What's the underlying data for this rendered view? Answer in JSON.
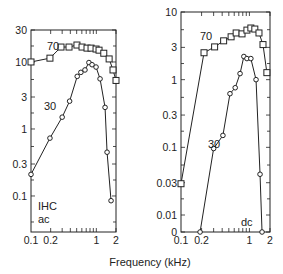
{
  "chart_data": [
    {
      "type": "line",
      "title": "",
      "panel_labels": [
        "IHC",
        "ac"
      ],
      "xlabel": "Frequency (kHz)",
      "ylabel": "",
      "xscale": "log",
      "yscale": "log",
      "xlim": [
        0.1,
        2
      ],
      "ylim": [
        0.029,
        30
      ],
      "xticks": [
        0.1,
        0.2,
        1,
        2
      ],
      "xtick_labels": [
        "0.1",
        "0.2",
        "1",
        "2"
      ],
      "yticks": [
        30,
        10,
        3,
        1,
        0.3,
        0.1
      ],
      "ytick_labels": [
        "30",
        "10",
        "3",
        "1",
        "0.3",
        "0.1"
      ],
      "grid": false,
      "series": [
        {
          "name": "70",
          "marker": "square",
          "x": [
            0.1,
            0.195,
            0.288,
            0.382,
            0.505,
            0.604,
            0.72,
            0.83,
            0.99,
            1.1,
            1.3,
            1.57,
            1.8,
            2.0
          ],
          "y": [
            10,
            11.4,
            16.7,
            16.7,
            17.9,
            16.7,
            16.1,
            16.1,
            15.6,
            15.0,
            13.5,
            11.1,
            7.6,
            5.3
          ]
        },
        {
          "name": "30",
          "marker": "circle",
          "x": [
            0.1,
            0.195,
            0.3,
            0.39,
            0.51,
            0.58,
            0.67,
            0.77,
            0.86,
            0.99,
            1.14,
            1.36,
            1.46,
            1.68
          ],
          "y": [
            0.21,
            0.73,
            1.5,
            2.6,
            6.1,
            7.0,
            7.6,
            9.8,
            9.1,
            8.4,
            5.6,
            2.1,
            0.45,
            0.085
          ]
        }
      ]
    },
    {
      "type": "line",
      "title": "",
      "panel_labels": [
        "dc"
      ],
      "xlabel": "Frequency (kHz)",
      "ylabel": "",
      "xscale": "log",
      "yscale": "log",
      "xlim": [
        0.1,
        2
      ],
      "ylim": [
        0,
        10
      ],
      "xticks": [
        0.1,
        0.2,
        1,
        2
      ],
      "xtick_labels": [
        "0.1",
        "0.2",
        "1",
        "2"
      ],
      "yticks": [
        10,
        3,
        1,
        0.3,
        0.1,
        0.03,
        0.01,
        0
      ],
      "ytick_labels": [
        "10",
        "3",
        "1",
        "0.3",
        "0.1",
        "0.03",
        "0.01",
        "0"
      ],
      "grid": false,
      "series": [
        {
          "name": "70",
          "marker": "square",
          "x": [
            0.1,
            0.217,
            0.31,
            0.42,
            0.54,
            0.64,
            0.78,
            0.92,
            1.05,
            1.2,
            1.38,
            1.58,
            1.8
          ],
          "y": [
            0.029,
            2.5,
            3.05,
            3.75,
            4.3,
            4.9,
            4.75,
            5.4,
            5.8,
            5.6,
            4.9,
            3.3,
            1.27
          ]
        },
        {
          "name": "30",
          "marker": "circle",
          "x": [
            0.19,
            0.3,
            0.41,
            0.52,
            0.62,
            0.73,
            0.83,
            0.92,
            1.05,
            1.25,
            1.43,
            1.53
          ],
          "y": [
            0,
            0.096,
            0.15,
            0.62,
            0.76,
            1.23,
            2.2,
            2.05,
            2.05,
            1.0,
            0.04,
            0
          ]
        }
      ]
    }
  ],
  "shared_xlabel": "Frequency (kHz)"
}
